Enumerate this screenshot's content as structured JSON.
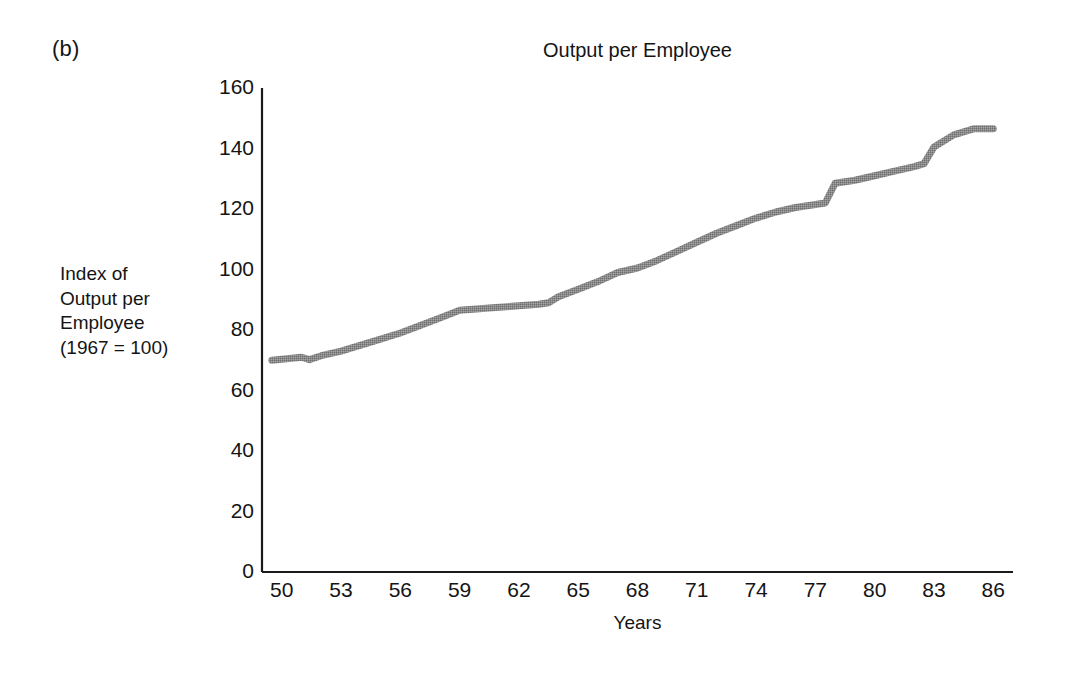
{
  "figure": {
    "panel_label": "(b)",
    "title": "Output per Employee",
    "line_color": "#8a8a8a",
    "axis_color": "#1a1a1a",
    "background": "#ffffff"
  },
  "ylabel_lines": {
    "line1": "Index of",
    "line2": "Output per",
    "line3": "Employee",
    "line4": "(1967 = 100)"
  },
  "xlabel": "Years",
  "chart_data": {
    "type": "line",
    "title": "Output per Employee",
    "xlabel": "Years",
    "ylabel": "Index of Output per Employee (1967 = 100)",
    "xlim": [
      49,
      87
    ],
    "ylim": [
      0,
      160
    ],
    "xticks": [
      50,
      53,
      56,
      59,
      62,
      65,
      68,
      71,
      74,
      77,
      80,
      83,
      86
    ],
    "xtick_labels": [
      "50",
      "53",
      "56",
      "59",
      "62",
      "65",
      "68",
      "71",
      "74",
      "77",
      "80",
      "83",
      "86"
    ],
    "yticks": [
      0,
      20,
      40,
      60,
      80,
      100,
      120,
      140,
      160
    ],
    "ytick_labels": [
      "0",
      "20",
      "40",
      "60",
      "80",
      "100",
      "120",
      "140",
      "160"
    ],
    "grid": false,
    "legend": false,
    "series": [
      {
        "name": "Index of Output per Employee (1967 = 100)",
        "x": [
          49.5,
          50,
          51,
          51.4,
          52,
          53,
          54,
          55,
          56,
          57,
          58,
          59,
          60,
          61,
          62,
          63,
          63.5,
          64,
          65,
          66,
          67,
          68,
          69,
          70,
          71,
          72,
          73,
          74,
          75,
          76,
          77,
          77.5,
          78,
          79,
          80,
          81,
          82,
          82.5,
          83,
          84,
          85,
          86
        ],
        "y": [
          70,
          70.3,
          71,
          70.2,
          71.5,
          73,
          75,
          77,
          79,
          81.5,
          84,
          86.5,
          87,
          87.5,
          88,
          88.5,
          89,
          91,
          93.5,
          96,
          99,
          100.5,
          103,
          106,
          109,
          112,
          114.5,
          117,
          119,
          120.5,
          121.5,
          122,
          128.5,
          129.5,
          131,
          132.5,
          134,
          135,
          140.5,
          144.5,
          146.5,
          146.5
        ]
      }
    ]
  }
}
